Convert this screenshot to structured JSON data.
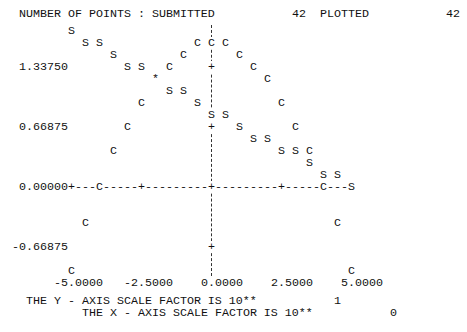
{
  "header": {
    "label": "NUMBER OF POINTS : SUBMITTED",
    "submitted": "42",
    "plotted_label": "PLOTTED",
    "plotted": "42"
  },
  "y_axis": {
    "ticks": [
      {
        "label": "1.33750",
        "value": 1.3375
      },
      {
        "label": "0.66875",
        "value": 0.66875
      },
      {
        "label": "0.00000",
        "value": 0.0
      },
      {
        "label": "-0.66875",
        "value": -0.66875
      }
    ]
  },
  "x_axis": {
    "ticks": [
      {
        "label": "-5.0000",
        "value": -5.0
      },
      {
        "label": "-2.5000",
        "value": -2.5
      },
      {
        "label": "0.0000",
        "value": 0.0
      },
      {
        "label": "2.5000",
        "value": 2.5
      },
      {
        "label": "5.0000",
        "value": 5.0
      }
    ]
  },
  "axis_glyphs": {
    "line": "-",
    "tick": "+"
  },
  "footer": {
    "y_scale_text": "THE Y - AXIS SCALE FACTOR IS 10**",
    "y_scale_exp": "1",
    "x_scale_text": "THE X - AXIS SCALE FACTOR IS 10**",
    "x_scale_exp": "0"
  },
  "chart_data": {
    "type": "scatter",
    "title": "",
    "xlabel": "",
    "ylabel": "",
    "points_submitted": 42,
    "points_plotted": 42,
    "x": [
      -5.0,
      -4.5,
      -4.0,
      -3.5,
      -3.0,
      -2.5,
      -2.0,
      -1.5,
      -1.0,
      -0.5,
      0.0,
      0.5,
      1.0,
      1.5,
      2.0,
      2.5,
      3.0,
      3.5,
      4.0,
      4.5,
      5.0
    ],
    "series": [
      {
        "name": "S",
        "symbol": "S",
        "values": [
          1.73875,
          1.605,
          1.605,
          1.47125,
          1.3375,
          1.3375,
          1.20375,
          1.07,
          1.07,
          0.93625,
          0.8025,
          0.8025,
          0.66875,
          0.535,
          0.535,
          0.40125,
          0.40125,
          0.2675,
          0.13375,
          0.13375,
          0.0
        ]
      },
      {
        "name": "C",
        "symbol": "C",
        "values": [
          -0.93625,
          -0.40125,
          0.0,
          0.40125,
          0.66875,
          0.93625,
          1.20375,
          1.3375,
          1.47125,
          1.605,
          1.605,
          1.605,
          1.47125,
          1.3375,
          1.20375,
          0.93625,
          0.66875,
          0.40125,
          0.0,
          -0.40125,
          -0.93625
        ]
      }
    ],
    "overlap_symbol": "*",
    "x_ticks": [
      -5.0,
      -2.5,
      0.0,
      2.5,
      5.0
    ],
    "y_ticks": [
      1.3375,
      0.66875,
      0.0,
      -0.66875
    ],
    "xlim": [
      -5.0,
      5.0
    ],
    "ylim": [
      -0.93625,
      1.73875
    ],
    "y_scale_factor": "10**1",
    "x_scale_factor": "10**0",
    "grid": false,
    "legend": "none"
  }
}
